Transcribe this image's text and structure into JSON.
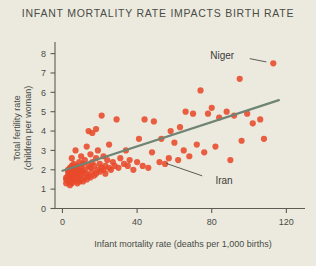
{
  "chart_data": {
    "type": "scatter",
    "title": "INFANT MORTALITY RATE IMPACTS BIRTH RATE",
    "xlabel": "Infant mortality rate (deaths per 1,000 births)",
    "ylabel_line1": "Total fertility rate",
    "ylabel_line2": "(children per woman)",
    "xlim": [
      -4,
      130
    ],
    "ylim": [
      0,
      8.6
    ],
    "xticks": [
      0,
      40,
      80,
      120
    ],
    "xtick_labels": [
      "0",
      "40",
      "80",
      "120"
    ],
    "yticks": [
      0,
      1,
      2,
      3,
      4,
      5,
      6,
      7,
      8
    ],
    "ytick_labels": [
      "0",
      "1",
      "2",
      "3",
      "4",
      "5",
      "6",
      "7",
      "8"
    ],
    "grid": false,
    "legend": "none",
    "marker_color": "#e8492a",
    "trend_color": "#6f8474",
    "background_color": "#eceade",
    "text_color": "#4a4a46",
    "series": [
      {
        "name": "Countries",
        "points": [
          [
            2,
            1.3
          ],
          [
            2,
            1.5
          ],
          [
            2,
            1.6
          ],
          [
            3,
            1.4
          ],
          [
            3,
            1.7
          ],
          [
            3,
            1.9
          ],
          [
            3,
            2.0
          ],
          [
            4,
            1.2
          ],
          [
            4,
            1.5
          ],
          [
            4,
            1.8
          ],
          [
            4,
            2.1
          ],
          [
            5,
            1.3
          ],
          [
            5,
            1.6
          ],
          [
            5,
            1.9
          ],
          [
            5,
            2.2
          ],
          [
            5,
            2.6
          ],
          [
            6,
            1.4
          ],
          [
            6,
            1.7
          ],
          [
            6,
            2.0
          ],
          [
            6,
            2.3
          ],
          [
            7,
            1.5
          ],
          [
            7,
            1.8
          ],
          [
            7,
            2.1
          ],
          [
            7,
            3.0
          ],
          [
            8,
            1.3
          ],
          [
            8,
            1.6
          ],
          [
            8,
            1.9
          ],
          [
            8,
            2.2
          ],
          [
            9,
            1.4
          ],
          [
            9,
            1.7
          ],
          [
            9,
            2.0
          ],
          [
            9,
            2.4
          ],
          [
            10,
            1.5
          ],
          [
            10,
            1.8
          ],
          [
            10,
            2.1
          ],
          [
            10,
            2.7
          ],
          [
            11,
            1.4
          ],
          [
            11,
            1.9
          ],
          [
            11,
            2.3
          ],
          [
            12,
            1.6
          ],
          [
            12,
            2.0
          ],
          [
            12,
            2.5
          ],
          [
            13,
            1.5
          ],
          [
            13,
            1.8
          ],
          [
            13,
            3.2
          ],
          [
            14,
            1.7
          ],
          [
            14,
            2.2
          ],
          [
            14,
            4.0
          ],
          [
            15,
            1.6
          ],
          [
            15,
            2.1
          ],
          [
            15,
            2.8
          ],
          [
            16,
            1.9
          ],
          [
            16,
            2.4
          ],
          [
            16,
            3.9
          ],
          [
            17,
            1.7
          ],
          [
            17,
            2.2
          ],
          [
            18,
            1.8
          ],
          [
            18,
            2.6
          ],
          [
            18,
            4.1
          ],
          [
            19,
            2.0
          ],
          [
            19,
            3.0
          ],
          [
            20,
            1.9
          ],
          [
            20,
            2.3
          ],
          [
            21,
            2.1
          ],
          [
            21,
            4.8
          ],
          [
            22,
            2.0
          ],
          [
            22,
            2.7
          ],
          [
            23,
            1.8
          ],
          [
            23,
            2.2
          ],
          [
            24,
            2.5
          ],
          [
            25,
            2.1
          ],
          [
            25,
            3.3
          ],
          [
            26,
            2.0
          ],
          [
            27,
            2.4
          ],
          [
            28,
            2.2
          ],
          [
            29,
            4.6
          ],
          [
            30,
            2.1
          ],
          [
            31,
            2.6
          ],
          [
            33,
            2.3
          ],
          [
            34,
            3.0
          ],
          [
            35,
            2.2
          ],
          [
            36,
            2.5
          ],
          [
            38,
            2.0
          ],
          [
            40,
            2.4
          ],
          [
            41,
            3.6
          ],
          [
            43,
            2.2
          ],
          [
            44,
            4.6
          ],
          [
            46,
            2.1
          ],
          [
            48,
            2.9
          ],
          [
            49,
            4.5
          ],
          [
            52,
            2.4
          ],
          [
            53,
            3.6
          ],
          [
            55,
            2.3
          ],
          [
            57,
            2.6
          ],
          [
            58,
            4.0
          ],
          [
            60,
            3.4
          ],
          [
            62,
            2.5
          ],
          [
            63,
            4.2
          ],
          [
            65,
            3.0
          ],
          [
            66,
            5.0
          ],
          [
            68,
            2.7
          ],
          [
            70,
            4.9
          ],
          [
            72,
            3.3
          ],
          [
            74,
            6.1
          ],
          [
            76,
            2.9
          ],
          [
            78,
            4.9
          ],
          [
            80,
            5.2
          ],
          [
            82,
            3.2
          ],
          [
            84,
            4.7
          ],
          [
            88,
            5.0
          ],
          [
            90,
            2.5
          ],
          [
            92,
            4.8
          ],
          [
            95,
            6.7
          ],
          [
            96,
            3.5
          ],
          [
            99,
            4.9
          ],
          [
            102,
            4.4
          ],
          [
            106,
            4.6
          ],
          [
            108,
            3.6
          ],
          [
            113,
            7.5
          ]
        ]
      }
    ],
    "trendline": {
      "x0": 0,
      "y0": 1.95,
      "x1": 116,
      "y1": 5.6
    },
    "annotations": [
      {
        "label": "Niger",
        "label_x": 92,
        "label_y": 7.9,
        "point_x": 113,
        "point_y": 7.5
      },
      {
        "label": "Iran",
        "label_x": 82,
        "label_y": 1.45,
        "point_x": 52,
        "point_y": 2.45
      }
    ]
  }
}
